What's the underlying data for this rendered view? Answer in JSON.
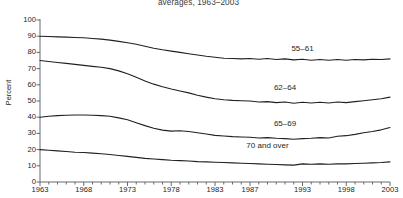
{
  "chart_data": {
    "type": "line",
    "title": "averages, 1963–2003",
    "xlabel": "",
    "ylabel": "Percent",
    "ylim": [
      0,
      100
    ],
    "xlim": [
      1963,
      2003
    ],
    "ytick_labels": [
      "0",
      "10",
      "20",
      "30",
      "40",
      "50",
      "60",
      "70",
      "80",
      "90",
      "100"
    ],
    "ytick_values": [
      0,
      10,
      20,
      30,
      40,
      50,
      60,
      70,
      80,
      90,
      100
    ],
    "xtick_labels": [
      "1963",
      "1968",
      "1973",
      "1978",
      "1983",
      "1987",
      "1993",
      "1998",
      "2003"
    ],
    "xtick_values": [
      1963,
      1968,
      1973,
      1978,
      1983,
      1987,
      1993,
      1998,
      2003
    ],
    "grid": false,
    "legend_position": "inline-labels",
    "line_color": "#231f20",
    "x": [
      1963,
      1964,
      1965,
      1966,
      1967,
      1968,
      1969,
      1970,
      1971,
      1972,
      1973,
      1974,
      1975,
      1976,
      1977,
      1978,
      1979,
      1980,
      1981,
      1982,
      1983,
      1984,
      1985,
      1986,
      1987,
      1988,
      1989,
      1990,
      1991,
      1992,
      1993,
      1994,
      1995,
      1996,
      1997,
      1998,
      1999,
      2000,
      2001,
      2002,
      2003
    ],
    "series": [
      {
        "name": "55–61",
        "label": "55–61",
        "values": [
          90.0,
          89.8,
          89.6,
          89.4,
          89.2,
          89.0,
          88.6,
          88.2,
          87.6,
          86.8,
          86.0,
          85.0,
          83.8,
          82.6,
          81.6,
          80.8,
          80.0,
          79.2,
          78.4,
          77.6,
          77.0,
          76.4,
          76.2,
          76.0,
          76.2,
          75.8,
          76.2,
          75.6,
          76.0,
          75.4,
          75.8,
          75.2,
          75.6,
          75.2,
          75.6,
          75.2,
          75.6,
          75.4,
          75.8,
          75.6,
          76.0
        ]
      },
      {
        "name": "62–64",
        "label": "62–64",
        "values": [
          75.0,
          74.4,
          73.8,
          73.2,
          72.6,
          72.0,
          71.4,
          70.8,
          70.0,
          68.6,
          66.8,
          64.6,
          62.4,
          60.4,
          58.8,
          57.4,
          56.2,
          55.0,
          53.6,
          52.4,
          51.4,
          50.8,
          50.4,
          50.2,
          50.0,
          49.4,
          49.6,
          49.0,
          49.4,
          48.6,
          49.2,
          48.8,
          49.2,
          48.8,
          49.4,
          49.0,
          49.6,
          50.2,
          50.8,
          51.4,
          52.4
        ]
      },
      {
        "name": "65–69",
        "label": "65–69",
        "values": [
          40.0,
          40.6,
          41.0,
          41.2,
          41.4,
          41.4,
          41.2,
          41.0,
          40.6,
          39.6,
          38.4,
          36.6,
          34.8,
          33.2,
          32.0,
          31.4,
          31.6,
          31.2,
          30.4,
          29.6,
          28.8,
          28.4,
          28.0,
          27.8,
          27.6,
          27.2,
          27.4,
          27.0,
          26.8,
          26.4,
          26.8,
          27.0,
          27.4,
          27.2,
          28.2,
          28.6,
          29.4,
          30.4,
          31.2,
          32.2,
          33.6
        ]
      },
      {
        "name": "70 and over",
        "label": "70 and over",
        "values": [
          20.0,
          19.6,
          19.2,
          18.8,
          18.4,
          18.2,
          17.8,
          17.4,
          17.0,
          16.4,
          15.8,
          15.2,
          14.6,
          14.2,
          13.8,
          13.4,
          13.2,
          13.0,
          12.6,
          12.4,
          12.2,
          12.0,
          11.8,
          11.6,
          11.4,
          11.2,
          11.0,
          10.8,
          10.6,
          10.4,
          11.2,
          11.0,
          11.2,
          11.0,
          11.2,
          11.2,
          11.4,
          11.6,
          11.8,
          12.0,
          12.4
        ]
      }
    ],
    "series_label_positions": [
      {
        "x": 1993,
        "y": 82
      },
      {
        "x": 1991,
        "y": 58
      },
      {
        "x": 1991,
        "y": 36
      },
      {
        "x": 1989,
        "y": 22
      }
    ]
  }
}
